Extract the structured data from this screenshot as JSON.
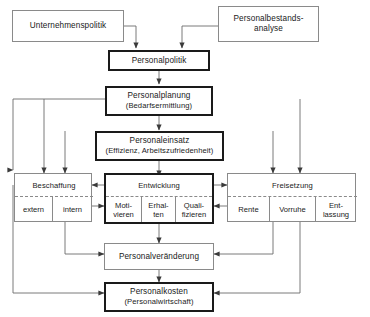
{
  "diagram": {
    "language": "de",
    "colors": {
      "background": "#ffffff",
      "thin_border": "#8a8a8a",
      "bold_border": "#1a1a1a",
      "text": "#1a1a1a",
      "connector": "#555555"
    },
    "nodes": {
      "unternehmenspolitik": {
        "label": "Unternehmenspolitik",
        "emphasis": "thin"
      },
      "personalbestandsanalyse": {
        "line1": "Personalbestands-",
        "line2": "analyse",
        "emphasis": "thin"
      },
      "personalpolitik": {
        "label": "Personalpolitik",
        "emphasis": "bold"
      },
      "personalplanung": {
        "line1": "Personalplanung",
        "line2": "(Bedarfsermittlung)",
        "emphasis": "bold"
      },
      "personaleinsatz": {
        "line1": "Personaleinsatz",
        "line2": "(Effizienz, Arbeitszufriedenheit)",
        "emphasis": "bold"
      },
      "beschaffung": {
        "label": "Beschaffung",
        "emphasis": "thin",
        "cells": [
          "extern",
          "intern"
        ]
      },
      "entwicklung": {
        "label": "Entwicklung",
        "emphasis": "bold",
        "cells": [
          {
            "line1": "Moti-",
            "line2": "vieren"
          },
          {
            "line1": "Erhal-",
            "line2": "ten"
          },
          {
            "line1": "Quali-",
            "line2": "fizieren"
          }
        ]
      },
      "freisetzung": {
        "label": "Freisetzung",
        "emphasis": "thin",
        "cells": [
          {
            "line1": "Rente",
            "line2": ""
          },
          {
            "line1": "Vorruhe",
            "line2": ""
          },
          {
            "line1": "Ent-",
            "line2": "lassung"
          }
        ]
      },
      "personalveraenderung": {
        "label": "Personalveränderung",
        "emphasis": "thin"
      },
      "personalkosten": {
        "line1": "Personalkosten",
        "line2": "(Personalwirtschaft)",
        "emphasis": "bold"
      }
    }
  }
}
